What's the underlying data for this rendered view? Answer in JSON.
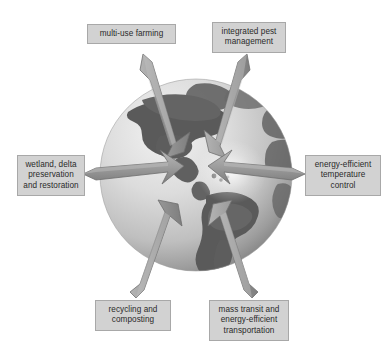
{
  "diagram": {
    "background_color": "#ffffff",
    "center": {
      "x": 196,
      "y": 175
    },
    "globe": {
      "name": "earth-globe",
      "description": "grayscale globe showing the Americas",
      "radius": 96,
      "ocean_color": "#d8d8d8",
      "land_color": "#6e6e6e",
      "shadow_color": "#8c8c8c"
    },
    "arrow_color": "#9a9a9a",
    "arrow_edge_color": "#6a6a6a",
    "label_box_color": "#d2d2d2",
    "label_border_color": "#a8a8a8",
    "label_text_color": "#2a2a2a",
    "callouts": [
      {
        "id": "multi-use-farming",
        "position": "top-left",
        "lines": [
          "multi-use farming"
        ],
        "arrow_direction": "down-right"
      },
      {
        "id": "integrated-pest-management",
        "position": "top-right",
        "lines": [
          "integrated pest",
          "management"
        ],
        "arrow_direction": "down-left"
      },
      {
        "id": "wetland-delta-preservation",
        "position": "left",
        "lines": [
          "wetland, delta",
          "preservation",
          "and restoration"
        ],
        "arrow_direction": "right"
      },
      {
        "id": "energy-efficient-temperature-control",
        "position": "right",
        "lines": [
          "energy-efficient",
          "temperature",
          "control"
        ],
        "arrow_direction": "left"
      },
      {
        "id": "recycling-and-composting",
        "position": "bottom-left",
        "lines": [
          "recycling and",
          "composting"
        ],
        "arrow_direction": "up-right"
      },
      {
        "id": "mass-transit-energy-efficient-transportation",
        "position": "bottom-right",
        "lines": [
          "mass transit and",
          "energy-efficient",
          "transportation"
        ],
        "arrow_direction": "up-left"
      }
    ]
  }
}
